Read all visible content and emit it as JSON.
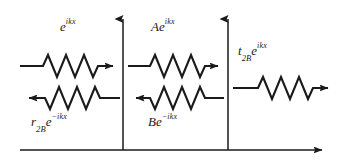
{
  "figure": {
    "name": "quantum-barrier-wave-diagram",
    "background_color": "#ffffff",
    "stroke_color": "#1a1a1a",
    "width": 346,
    "height": 161
  },
  "axes": {
    "baseline": {
      "label": "horizontal-axis",
      "y": 150,
      "x_start": 20,
      "x_end": 328,
      "arrow": "right"
    },
    "vertical_left": {
      "label": "barrier-boundary-left",
      "x": 123,
      "y_top": 12,
      "y_bottom": 150,
      "arrow": "up"
    },
    "vertical_right": {
      "label": "barrier-boundary-right",
      "x": 228,
      "y_top": 12,
      "y_bottom": 150,
      "arrow": "up"
    }
  },
  "labels": {
    "incident": {
      "base": "e",
      "sup": "ikx"
    },
    "reflected": {
      "base": "r",
      "sub": "2B",
      "base2": "e",
      "sup": "−ikx"
    },
    "middle_forward": {
      "base": "Ae",
      "sup": "ikx"
    },
    "middle_backward": {
      "base": "Be",
      "sup": "−ikx"
    },
    "transmitted": {
      "base": "t",
      "sub": "2B",
      "base2": "e",
      "sup": "ikx"
    }
  },
  "waves": [
    {
      "name": "incident-wave",
      "direction": "right",
      "y": 66,
      "x_start": 20,
      "x_end": 120,
      "cycles": 3
    },
    {
      "name": "reflected-wave",
      "direction": "left",
      "y": 98,
      "x_start": 20,
      "x_end": 120,
      "cycles": 3
    },
    {
      "name": "middle-forward-wave",
      "direction": "right",
      "y": 66,
      "x_start": 128,
      "x_end": 224,
      "cycles": 3
    },
    {
      "name": "middle-backward-wave",
      "direction": "left",
      "y": 98,
      "x_start": 128,
      "x_end": 224,
      "cycles": 3
    },
    {
      "name": "transmitted-wave",
      "direction": "right",
      "y": 88,
      "x_start": 233,
      "x_end": 335,
      "cycles": 3
    }
  ]
}
